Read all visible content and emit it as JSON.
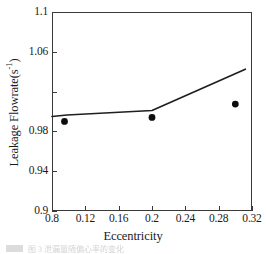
{
  "chart_data": {
    "type": "line",
    "title": "",
    "xlabel": "Eccentricity",
    "ylabel": "Leakage Flowrate(s",
    "ylabel_superscript": "-1",
    "ylabel_suffix": ")",
    "xlim": [
      0.08,
      0.32
    ],
    "ylim": [
      0.9,
      1.1
    ],
    "grid": false,
    "legend": "none",
    "xticks": [
      {
        "value": 0.08,
        "label": "0.8"
      },
      {
        "value": 0.12,
        "label": "0.12"
      },
      {
        "value": 0.16,
        "label": "0.16"
      },
      {
        "value": 0.2,
        "label": "0.2"
      },
      {
        "value": 0.24,
        "label": "0.24"
      },
      {
        "value": 0.28,
        "label": "0.28"
      },
      {
        "value": 0.32,
        "label": "0.32"
      }
    ],
    "yticks": [
      {
        "value": 1.1,
        "label": "1.1"
      },
      {
        "value": 1.06,
        "label": "1.06"
      },
      {
        "value": 1.02,
        "label": ""
      },
      {
        "value": 0.98,
        "label": "0.98"
      },
      {
        "value": 0.94,
        "label": "0.94"
      },
      {
        "value": 0.9,
        "label": "0.9"
      }
    ],
    "series": [
      {
        "name": "prediction-line",
        "kind": "line",
        "color": "#1f1f1f",
        "x": [
          0.08,
          0.098,
          0.2,
          0.312
        ],
        "y": [
          0.995,
          0.9965,
          1.001,
          1.0425
        ]
      },
      {
        "name": "experimental-points",
        "kind": "scatter",
        "marker": "filled-circle",
        "color": "#0d0d0d",
        "x": [
          0.095,
          0.2,
          0.3
        ],
        "y": [
          0.99,
          0.994,
          1.0075
        ]
      }
    ]
  },
  "caption": {
    "text": "图 3 泄漏量随偏心率的变化"
  }
}
